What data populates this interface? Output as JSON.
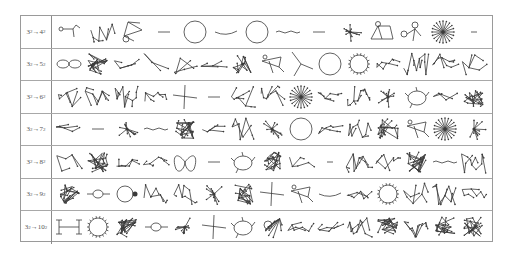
{
  "table": {
    "rows": [
      {
        "from": "3",
        "to": "4",
        "sub": "2",
        "cells": [
          "path-loop",
          "tangle",
          "triangle-loop",
          "dash",
          "circle",
          "curve",
          "circle",
          "wavy",
          "dash",
          "star-cluster",
          "house",
          "double-loop",
          "big-star",
          "short-dash"
        ]
      },
      {
        "from": "3",
        "to": "5",
        "sub": "2",
        "cells": [
          "figure-eight",
          "dense-tangle",
          "chain",
          "sparse",
          "branch",
          "zigzag",
          "cluster",
          "kite",
          "tripod",
          "circle",
          "spiky-circle",
          "chain-cluster",
          "tree-cluster",
          "branched-tree",
          "ring"
        ]
      },
      {
        "from": "3",
        "to": "6",
        "sub": "2",
        "cells": [
          "tangle",
          "branched-tree",
          "tree-cluster",
          "chain-cluster",
          "cross",
          "dash",
          "branched-tree",
          "tree-cluster",
          "big-star",
          "chain-cluster",
          "tree-cluster",
          "star-cluster",
          "loop-cluster",
          "dash-branch",
          "dense-tangle"
        ]
      },
      {
        "from": "3",
        "to": "7",
        "sub": "2",
        "cells": [
          "chain",
          "dash",
          "star-cluster",
          "wavy",
          "dense-tangle",
          "chain",
          "kite-star",
          "star-cluster",
          "circle",
          "chain-cluster",
          "branched-tree",
          "dense-tangle",
          "kite",
          "big-star",
          "star-cluster"
        ]
      },
      {
        "from": "3",
        "to": "8",
        "sub": "2",
        "cells": [
          "branch",
          "dense-tangle",
          "chain-cluster",
          "chain-cluster",
          "butterfly",
          "dash",
          "loop-cluster",
          "dense-tangle",
          "chain",
          "short-dash",
          "tree-cluster",
          "kite-star",
          "dense-tangle",
          "wavy",
          "tree-cluster"
        ]
      },
      {
        "from": "3",
        "to": "9",
        "sub": "2",
        "cells": [
          "dense-tangle",
          "loop-chain",
          "ring-knot",
          "tangle",
          "tripod-branch",
          "star-cluster",
          "dense-tangle",
          "cross",
          "kite",
          "curve",
          "chain-cluster",
          "spiky-circle",
          "tangle",
          "branched-tree",
          "chain-cluster"
        ]
      },
      {
        "from": "3",
        "to": "10",
        "sub": "2",
        "cells": [
          "tree-h",
          "spiky-circle",
          "dense-tangle",
          "loop-chain",
          "star-cluster",
          "cross",
          "loop-cluster",
          "loop-star",
          "chain-cluster",
          "chain-cluster",
          "tree-cluster",
          "dense-tangle",
          "tree-cluster",
          "dense-tangle",
          "dense-tangle"
        ]
      }
    ]
  },
  "colors": {
    "stroke": "#3a3a3a",
    "border": "#9a9a9a",
    "label": "#555555"
  }
}
